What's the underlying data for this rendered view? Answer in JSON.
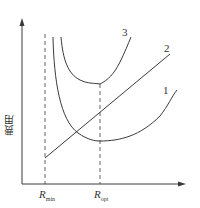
{
  "diagram": {
    "y_axis_label": "费用",
    "x_ticks": [
      {
        "main": "R",
        "sub": "min"
      },
      {
        "main": "R",
        "sub": "opt"
      }
    ],
    "curve_labels": [
      "1",
      "2",
      "3"
    ],
    "colors": {
      "line": "#3a3a3a",
      "background": "#ffffff"
    }
  }
}
